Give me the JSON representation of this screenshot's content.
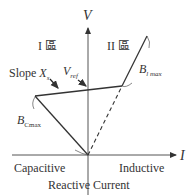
{
  "axes": {
    "y_label": "V",
    "x_label": "I",
    "x_left_label": "Capacitive",
    "x_right_label": "Inductive",
    "x_title": "Reactive Current"
  },
  "regions": {
    "region1": "I 區",
    "region2": "II 區"
  },
  "annotations": {
    "slope_prefix": "Slope ",
    "slope_var": "X",
    "slope_sub": "s",
    "vref_var": "V",
    "vref_sub": "ref",
    "bl_var": "B",
    "bl_sub": "l max",
    "bc_var": "B",
    "bc_sub": "Cmax"
  },
  "colors": {
    "line": "#333333",
    "text": "#333333"
  }
}
